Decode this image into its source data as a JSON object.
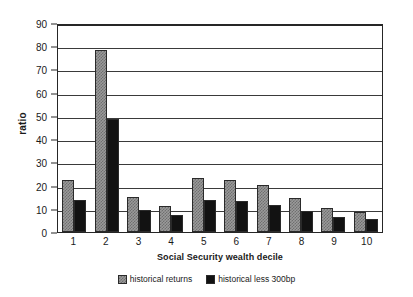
{
  "chart_data": {
    "type": "bar",
    "title": "",
    "xlabel": "Social Security wealth decile",
    "ylabel": "ratio",
    "categories": [
      "1",
      "2",
      "3",
      "4",
      "5",
      "6",
      "7",
      "8",
      "9",
      "10"
    ],
    "series": [
      {
        "name": "historical returns",
        "values": [
          22.6,
          78.2,
          15.1,
          11.0,
          23.2,
          22.2,
          20.3,
          14.8,
          10.5,
          8.8
        ]
      },
      {
        "name": "historical less 300bp",
        "values": [
          13.8,
          48.5,
          9.4,
          7.2,
          14.0,
          13.2,
          11.6,
          9.0,
          6.6,
          5.4
        ]
      }
    ],
    "ylim": [
      0,
      90
    ],
    "yticks": [
      0,
      10,
      20,
      30,
      40,
      50,
      60,
      70,
      80,
      90
    ],
    "ytick_labels": [
      "0",
      "10",
      "20",
      "30",
      "40",
      "50",
      "60",
      "70",
      "80",
      "90"
    ],
    "grid": true,
    "legend_position": "bottom",
    "colors": {
      "series_a_fill": "#9a9a9a",
      "series_a_hatch": "#6f6f6f",
      "series_b_fill": "#121212",
      "axis": "#262626",
      "gridline": "#3a3a3a",
      "background": "#ffffff"
    }
  }
}
